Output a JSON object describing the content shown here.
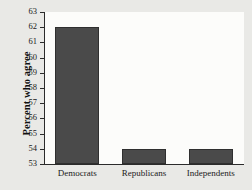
{
  "chart_data": {
    "type": "bar",
    "title": "",
    "xlabel": "",
    "ylabel": "Percent who agree",
    "categories": [
      "Democrats",
      "Republicans",
      "Independents"
    ],
    "values": [
      62,
      54,
      54
    ],
    "ylim": [
      53,
      63
    ],
    "ytick_step": 1,
    "yticks": [
      53,
      54,
      55,
      56,
      57,
      58,
      59,
      60,
      61,
      62,
      63
    ],
    "ytick_labels": [
      "53",
      "54",
      "55",
      "56",
      "57",
      "58",
      "59",
      "60",
      "61",
      "62",
      "63"
    ],
    "grid": false,
    "legend": null,
    "bar_color": "#4a4a4a",
    "plot_background": "#fcfcfa",
    "page_background": "#e9e9e6",
    "axis_color": "#2b2b2b"
  }
}
